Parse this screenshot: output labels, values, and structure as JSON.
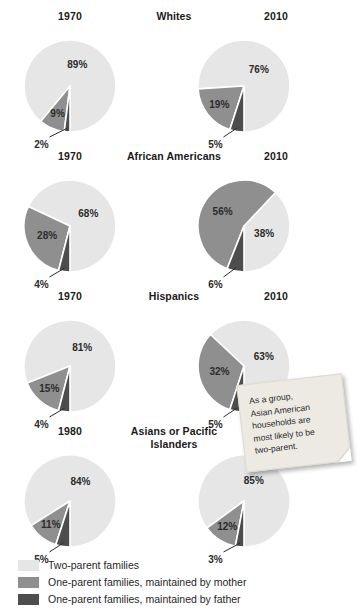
{
  "colors": {
    "two_parent": "#e6e6e6",
    "mother": "#8f8f8f",
    "father": "#4d4d4d",
    "gap": "#ffffff",
    "text": "#221f1f",
    "note_bg": "#eceae3"
  },
  "legend": {
    "items": [
      {
        "label": "Two-parent families",
        "swatch": "#e6e6e6",
        "name": "legend-two-parent"
      },
      {
        "label": "One-parent families, maintained by mother",
        "swatch": "#8f8f8f",
        "name": "legend-mother"
      },
      {
        "label": "One-parent families, maintained by father",
        "swatch": "#4d4d4d",
        "name": "legend-father"
      }
    ]
  },
  "note": {
    "line1": "As a group,",
    "line2": "Asian American",
    "line3": "households are",
    "line4": "most likely to be",
    "line5": "two-parent."
  },
  "groups": [
    {
      "name": "whites",
      "label": "Whites",
      "left_year": "1970",
      "right_year": "2010",
      "left": {
        "two_parent": "89%",
        "mother": "9%",
        "father": "2%"
      },
      "right": {
        "two_parent": "76%",
        "mother": "19%",
        "father": "5%"
      }
    },
    {
      "name": "african-americans",
      "label": "African Americans",
      "left_year": "1970",
      "right_year": "2010",
      "left": {
        "two_parent": "68%",
        "mother": "28%",
        "father": "4%"
      },
      "right": {
        "two_parent": "38%",
        "mother": "56%",
        "father": "6%"
      }
    },
    {
      "name": "hispanics",
      "label": "Hispanics",
      "left_year": "1970",
      "right_year": "2010",
      "left": {
        "two_parent": "81%",
        "mother": "15%",
        "father": "4%"
      },
      "right": {
        "two_parent": "63%",
        "mother": "32%",
        "father": "5%"
      }
    },
    {
      "name": "asians-or-pacific-islanders",
      "label": "Asians or Pacific Islanders",
      "left_year": "1980",
      "right_year": "2010",
      "left": {
        "two_parent": "84%",
        "mother": "11%",
        "father": "5%"
      },
      "right": {
        "two_parent": "85%",
        "mother": "12%",
        "father": "3%"
      }
    }
  ],
  "chart_data": {
    "type": "pie",
    "title": "",
    "legend_position": "bottom",
    "categories": [
      "Two-parent families",
      "One-parent families, maintained by mother",
      "One-parent families, maintained by father"
    ],
    "charts": [
      {
        "group": "Whites",
        "year": "1970",
        "values": [
          89,
          9,
          2
        ]
      },
      {
        "group": "Whites",
        "year": "2010",
        "values": [
          76,
          19,
          5
        ]
      },
      {
        "group": "African Americans",
        "year": "1970",
        "values": [
          68,
          28,
          4
        ]
      },
      {
        "group": "African Americans",
        "year": "2010",
        "values": [
          38,
          56,
          6
        ]
      },
      {
        "group": "Hispanics",
        "year": "1970",
        "values": [
          81,
          15,
          4
        ]
      },
      {
        "group": "Hispanics",
        "year": "2010",
        "values": [
          63,
          32,
          5
        ]
      },
      {
        "group": "Asians or Pacific Islanders",
        "year": "1980",
        "values": [
          84,
          11,
          5
        ]
      },
      {
        "group": "Asians or Pacific Islanders",
        "year": "2010",
        "values": [
          85,
          12,
          3
        ]
      }
    ],
    "annotation": "As a group, Asian American households are most likely to be two-parent."
  }
}
